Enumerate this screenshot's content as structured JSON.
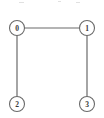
{
  "figure": {
    "type": "undirected-graph-diagram",
    "width": 104,
    "height": 118,
    "background_color": "#ffffff",
    "stroke_color": "#6a6a6a",
    "node_fill_color": "#ffffff",
    "label_color": "#3a3a3a"
  },
  "graph": {
    "node_radius": 7.5,
    "edge_width": 1.2,
    "node_stroke_width": 1.1,
    "nodes": [
      {
        "id": "0",
        "label": "0",
        "x": 17,
        "y": 28
      },
      {
        "id": "1",
        "label": "1",
        "x": 87,
        "y": 28
      },
      {
        "id": "2",
        "label": "2",
        "x": 17,
        "y": 104
      },
      {
        "id": "3",
        "label": "3",
        "x": 87,
        "y": 104
      }
    ],
    "edges": [
      {
        "id": "edge-0-1",
        "source": "0",
        "target": "1",
        "x1": 24.5,
        "y1": 28,
        "x2": 79.5,
        "y2": 28
      },
      {
        "id": "edge-0-2",
        "source": "0",
        "target": "2",
        "x1": 17,
        "y1": 35.5,
        "x2": 17,
        "y2": 96.5
      },
      {
        "id": "edge-1-3",
        "source": "1",
        "target": "3",
        "x1": 87,
        "y1": 35.5,
        "x2": 87,
        "y2": 96.5
      }
    ]
  },
  "artifacts": [
    {
      "id": "artifact-left",
      "x": 19,
      "y": 2,
      "width": 5
    },
    {
      "id": "artifact-mid",
      "x": 58,
      "y": 1,
      "width": 3
    },
    {
      "id": "artifact-right",
      "x": 76,
      "y": 2,
      "width": 4
    }
  ]
}
